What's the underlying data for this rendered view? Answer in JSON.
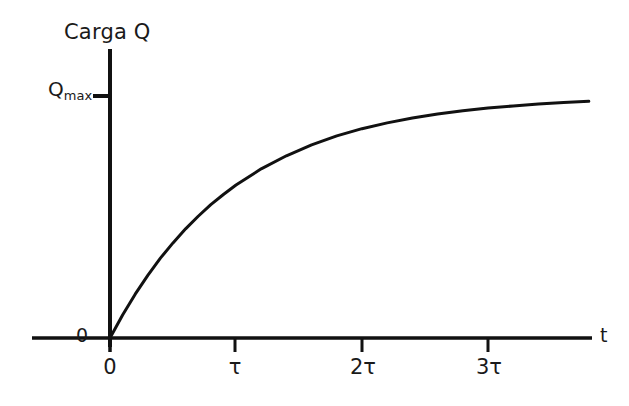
{
  "figure": {
    "background_color": "#ffffff",
    "ink_color": "#111111"
  },
  "chart_data": {
    "type": "line",
    "title": "",
    "subtitle": "",
    "ylabel": "Carga Q",
    "xlabel": "t",
    "grid": false,
    "legend": null,
    "annotations": [],
    "axes": {
      "x_axis_label": "t",
      "y_axis_label": "Carga Q",
      "x_tick_labels": [
        "0",
        "τ",
        "2τ",
        "3τ"
      ],
      "x_tick_values": [
        0,
        1,
        2,
        3
      ],
      "y_tick_labels": [
        "0",
        "Qmax"
      ],
      "y_tick_value_labels": [
        "0",
        "Q"
      ],
      "y_tick_subscripts": [
        "",
        "max"
      ],
      "xlim": [
        0,
        3.8
      ],
      "ylim": [
        0,
        1.08
      ]
    },
    "origin_label": "0",
    "series": [
      {
        "name": "Q(t) = Qmax (1 - e^(-t/τ))",
        "x": [
          0,
          0.1,
          0.2,
          0.3,
          0.4,
          0.5,
          0.6,
          0.7,
          0.8,
          0.9,
          1.0,
          1.2,
          1.4,
          1.6,
          1.8,
          2.0,
          2.2,
          2.4,
          2.6,
          2.8,
          3.0,
          3.2,
          3.4,
          3.6,
          3.8
        ],
        "y": [
          0.0,
          0.095,
          0.181,
          0.259,
          0.33,
          0.393,
          0.451,
          0.503,
          0.551,
          0.593,
          0.632,
          0.699,
          0.753,
          0.798,
          0.835,
          0.865,
          0.889,
          0.909,
          0.926,
          0.939,
          0.95,
          0.959,
          0.967,
          0.973,
          0.978
        ],
        "color": "#111111",
        "linewidth": 3
      }
    ],
    "asymptote": {
      "label": "Qmax",
      "value": 1.0
    }
  },
  "labels": {
    "y_axis_title": "Carga Q",
    "y_max_base": "Q",
    "y_max_subscript": "max",
    "origin": "0",
    "x_axis_title": "t",
    "x_tick_0": "0",
    "x_tick_tau": "τ",
    "x_tick_2tau": "2τ",
    "x_tick_3tau": "3τ"
  }
}
